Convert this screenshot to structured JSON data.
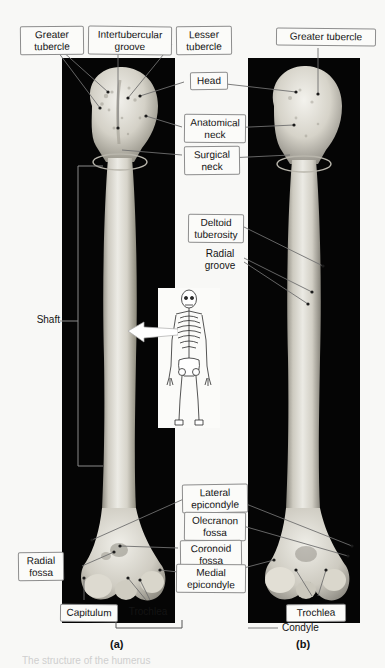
{
  "figure": {
    "views": [
      {
        "letter": "(a)",
        "name": "anterior-view"
      },
      {
        "letter": "(b)",
        "name": "posterior-view"
      }
    ],
    "caption": "The structure of the humerus"
  },
  "labels": {
    "greater_tubercle_a": "Greater\ntubercle",
    "intertubercular_groove": "Intertubercular\ngroove",
    "lesser_tubercle": "Lesser\ntubercle",
    "greater_tubercle_b": "Greater tubercle",
    "head": "Head",
    "anatomical_neck": "Anatomical\nneck",
    "surgical_neck": "Surgical\nneck",
    "deltoid_tuberosity": "Deltoid\ntuberosity",
    "radial_groove": "Radial\ngroove",
    "shaft": "Shaft",
    "lateral_epicondyle": "Lateral\nepicondyle",
    "olecranon_fossa": "Olecranon\nfossa",
    "coronoid_fossa": "Coronoid\nfossa",
    "medial_epicondyle": "Medial\nepicondyle",
    "radial_fossa": "Radial\nfossa",
    "capitulum": "Capitulum",
    "trochlea_a": "Trochlea",
    "trochlea_b": "Trochlea",
    "condyle": "Condyle"
  },
  "inset": {
    "name": "skeleton-orientation-inset",
    "description": "Full human skeleton with arrow indicating humerus"
  },
  "colors": {
    "page_background": "#f8f8f6",
    "plate_background": "#050505",
    "label_fill": "#fbfbf9",
    "label_border": "#8d8d8d",
    "leader_line": "#6f6f6f",
    "bone_light": "#e9e7e0",
    "bone_mid": "#c9c6bc",
    "bone_dark": "#9b978c",
    "text": "#141414"
  }
}
